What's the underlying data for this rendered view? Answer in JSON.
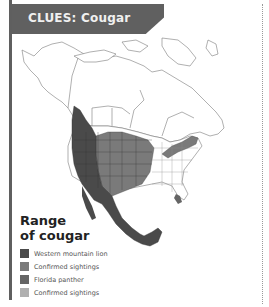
{
  "header": {
    "title": "CLUES: Cougar"
  },
  "legend": {
    "title_line1": "Range",
    "title_line2": "of cougar",
    "items": [
      {
        "label": "Western mountain lion",
        "color": "#4a4a4a"
      },
      {
        "label": "Confirmed sightings",
        "color": "#7a7a7a"
      },
      {
        "label": "Florida panther",
        "color": "#656565"
      },
      {
        "label": "Confirmed sightings",
        "color": "#b0b0b0"
      }
    ]
  },
  "map": {
    "subject": "North America cougar range map"
  }
}
